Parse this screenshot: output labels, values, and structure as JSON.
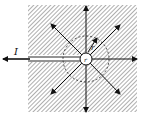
{
  "diagram": {
    "labels": {
      "current": "I",
      "radius_small": "r",
      "radius_dashed": "r"
    },
    "colors": {
      "hatch": "#555555",
      "line": "#111111",
      "background": "#ffffff"
    },
    "arrow_count": 8
  }
}
